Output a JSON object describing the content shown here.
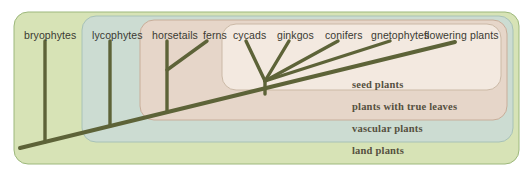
{
  "figure": {
    "type": "cladogram"
  },
  "colors": {
    "land_plants_fill": "#d7e3b6",
    "vascular_plants_fill": "#ccdcd2",
    "true_leaves_fill": "#e6d6c9",
    "seed_plants_fill": "#f3e9e0",
    "branch": "#5d6338",
    "border_green": "#9db87c",
    "border_blue": "#a8c2b7",
    "border_pink": "#c8ae9a",
    "border_cream": "#cbb9a6",
    "taxon_text": "#3a3a32",
    "clade_text": "#55503f",
    "background": "#ffffff"
  },
  "taxa": [
    {
      "label": "bryophytes",
      "x": 24,
      "y": 29
    },
    {
      "label": "lycophytes",
      "x": 92,
      "y": 29
    },
    {
      "label": "horsetails",
      "x": 152,
      "y": 29
    },
    {
      "label": "ferns",
      "x": 203,
      "y": 29
    },
    {
      "label": "cycads",
      "x": 233,
      "y": 29
    },
    {
      "label": "ginkgos",
      "x": 277,
      "y": 29
    },
    {
      "label": "conifers",
      "x": 325,
      "y": 29
    },
    {
      "label": "gnetophytes",
      "x": 371,
      "y": 29
    },
    {
      "label": "flowering plants",
      "x": 424,
      "y": 29
    }
  ],
  "clades": [
    {
      "label": "seed plants",
      "x": 352,
      "y": 79
    },
    {
      "label": "plants with true leaves",
      "x": 352,
      "y": 101
    },
    {
      "label": "vascular plants",
      "x": 352,
      "y": 123
    },
    {
      "label": "land plants",
      "x": 352,
      "y": 145
    }
  ],
  "boxes": [
    {
      "name": "land-plants-box",
      "x": 14,
      "y": 12,
      "w": 505,
      "h": 152,
      "rx": 14,
      "fill": "#d7e3b6",
      "stroke": "#9db87c"
    },
    {
      "name": "vascular-plants-box",
      "x": 82,
      "y": 16,
      "w": 431,
      "h": 126,
      "rx": 14,
      "fill": "#ccdcd2",
      "stroke": "#a8c2b7"
    },
    {
      "name": "true-leaves-box",
      "x": 140,
      "y": 20,
      "w": 367,
      "h": 100,
      "rx": 14,
      "fill": "#e6d6c9",
      "stroke": "#c8ae9a"
    },
    {
      "name": "seed-plants-box",
      "x": 222,
      "y": 24,
      "w": 279,
      "h": 66,
      "rx": 14,
      "fill": "#f3e9e0",
      "stroke": "#cbb9a6"
    }
  ],
  "branches": [
    {
      "name": "main-trunk",
      "x1": 20,
      "y1": 148,
      "x2": 455,
      "y2": 42
    },
    {
      "name": "bryophytes-stem",
      "x1": 45,
      "y1": 41,
      "x2": 45,
      "y2": 142
    },
    {
      "name": "lycophytes-stem",
      "x1": 110,
      "y1": 41,
      "x2": 110,
      "y2": 126
    },
    {
      "name": "horsetails-stem",
      "x1": 167,
      "y1": 41,
      "x2": 167,
      "y2": 112
    },
    {
      "name": "ferns-branch",
      "x1": 207,
      "y1": 41,
      "x2": 167,
      "y2": 70
    },
    {
      "name": "cycads-branch",
      "x1": 246,
      "y1": 41,
      "x2": 265,
      "y2": 81
    },
    {
      "name": "ginkgos-branch",
      "x1": 289,
      "y1": 41,
      "x2": 265,
      "y2": 81
    },
    {
      "name": "conifers-branch",
      "x1": 338,
      "y1": 41,
      "x2": 265,
      "y2": 81
    },
    {
      "name": "gnetophytes-branch",
      "x1": 390,
      "y1": 41,
      "x2": 265,
      "y2": 81
    },
    {
      "name": "seed-stem",
      "x1": 265,
      "y1": 81,
      "x2": 265,
      "y2": 94
    }
  ]
}
